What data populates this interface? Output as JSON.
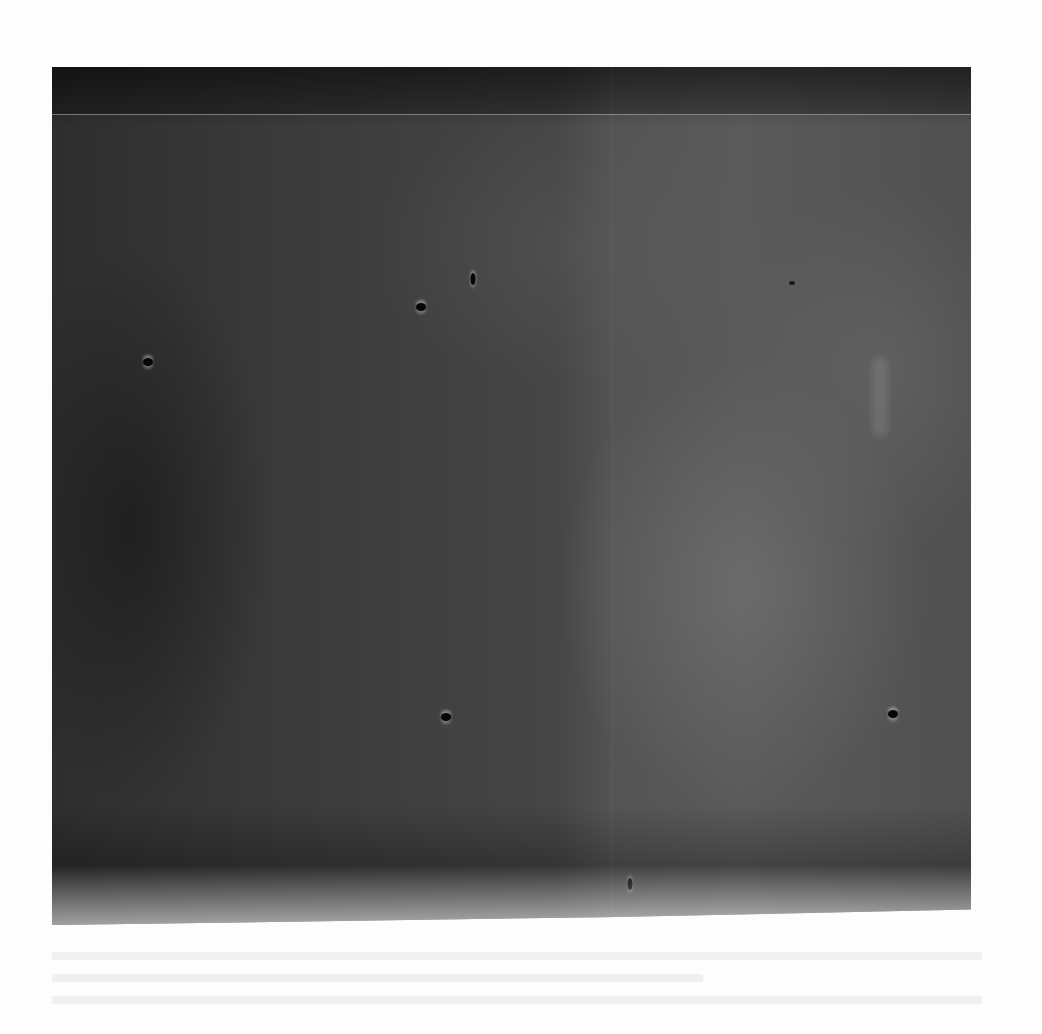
{
  "figure": {
    "type": "grayscale micrograph / detector image",
    "background_tone": "#3a3a3a",
    "features": {
      "dark_spots": [
        {
          "x": 148,
          "y": 362
        },
        {
          "x": 421,
          "y": 307
        },
        {
          "x": 473,
          "y": 279,
          "shape": "vertical"
        },
        {
          "x": 446,
          "y": 717
        },
        {
          "x": 893,
          "y": 714
        },
        {
          "x": 630,
          "y": 884,
          "shape": "vertical"
        },
        {
          "x": 792,
          "y": 283,
          "faint": true
        }
      ],
      "scan_line_y": 114,
      "seam_x": 612
    }
  },
  "caption": {
    "legible": false,
    "line_count": 3
  }
}
